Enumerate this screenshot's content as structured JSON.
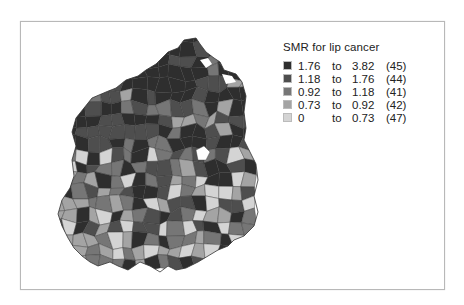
{
  "legend": {
    "title": "SMR for lip cancer",
    "classes": [
      {
        "low": "1.76",
        "sep": "to",
        "high": "3.82",
        "count": "(45)",
        "color": "#2e2e2e"
      },
      {
        "low": "1.18",
        "sep": "to",
        "high": "1.76",
        "count": "(44)",
        "color": "#4e4e4e"
      },
      {
        "low": "0.92",
        "sep": "to",
        "high": "1.18",
        "count": "(41)",
        "color": "#767676"
      },
      {
        "low": "0.73",
        "sep": "to",
        "high": "0.92",
        "count": "(42)",
        "color": "#a4a4a4"
      },
      {
        "low": "0",
        "sep": "to",
        "high": "0.73",
        "count": "(47)",
        "color": "#d4d4d4"
      }
    ]
  },
  "map": {
    "description": "Choropleth of districts, shaded by SMR class",
    "total_regions": 219
  }
}
